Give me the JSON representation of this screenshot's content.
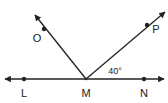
{
  "diagram": {
    "type": "geometry-angles",
    "line_color": "#222222",
    "background": "#ffffff",
    "points": {
      "L": {
        "label": "L",
        "x": 24,
        "y": 79
      },
      "M": {
        "label": "M",
        "x": 86,
        "y": 79
      },
      "N": {
        "label": "N",
        "x": 144,
        "y": 79
      },
      "O": {
        "label": "O",
        "x": 44,
        "y": 29
      },
      "P": {
        "label": "P",
        "x": 147,
        "y": 25
      }
    },
    "line": {
      "name": "line LN",
      "from": [
        5,
        79
      ],
      "to": [
        164,
        79
      ],
      "arrows": "both"
    },
    "rays": [
      {
        "name": "ray MO",
        "from": "M",
        "through": "O",
        "end": [
          35,
          15
        ]
      },
      {
        "name": "ray MP",
        "from": "M",
        "through": "P",
        "end": [
          165,
          12
        ]
      }
    ],
    "angle_label": {
      "text": "40°",
      "angle": "PMN"
    }
  }
}
